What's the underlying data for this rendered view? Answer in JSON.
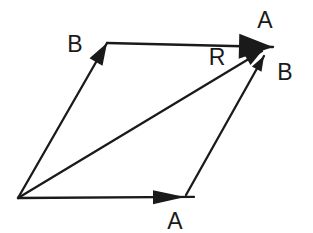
{
  "figure": {
    "background_color": "#ffffff",
    "stroke_color": "#1a1a1a",
    "stroke_width": 2.3,
    "vectors": [
      {
        "name": "vector-a-bottom",
        "from": [
          18,
          198
        ],
        "to": [
          185,
          197
        ],
        "overshoot": 9,
        "head": [
          32,
          7
        ]
      },
      {
        "name": "vector-b-left",
        "from": [
          18,
          198
        ],
        "to": [
          107,
          43
        ],
        "overshoot": 0,
        "head": [
          22,
          7.5
        ]
      },
      {
        "name": "vector-a-top",
        "from": [
          107,
          43
        ],
        "to": [
          273,
          47
        ],
        "overshoot": 0,
        "head": [
          34,
          12.5
        ]
      },
      {
        "name": "vector-b-right",
        "from": [
          186,
          195
        ],
        "to": [
          264,
          56
        ],
        "overshoot": 0,
        "head": [
          15,
          5.5
        ]
      },
      {
        "name": "vector-r",
        "from": [
          18,
          198
        ],
        "to": [
          262,
          51
        ],
        "overshoot": 0,
        "head": [
          17,
          6
        ]
      }
    ],
    "labels": [
      {
        "name": "label-b-left",
        "text": "B",
        "x": 75,
        "y": 44
      },
      {
        "name": "label-a-top",
        "text": "A",
        "x": 265,
        "y": 20
      },
      {
        "name": "label-r",
        "text": "R",
        "x": 217,
        "y": 57
      },
      {
        "name": "label-b-right",
        "text": "B",
        "x": 285,
        "y": 72
      },
      {
        "name": "label-a-bottom",
        "text": "A",
        "x": 175,
        "y": 221
      }
    ]
  }
}
